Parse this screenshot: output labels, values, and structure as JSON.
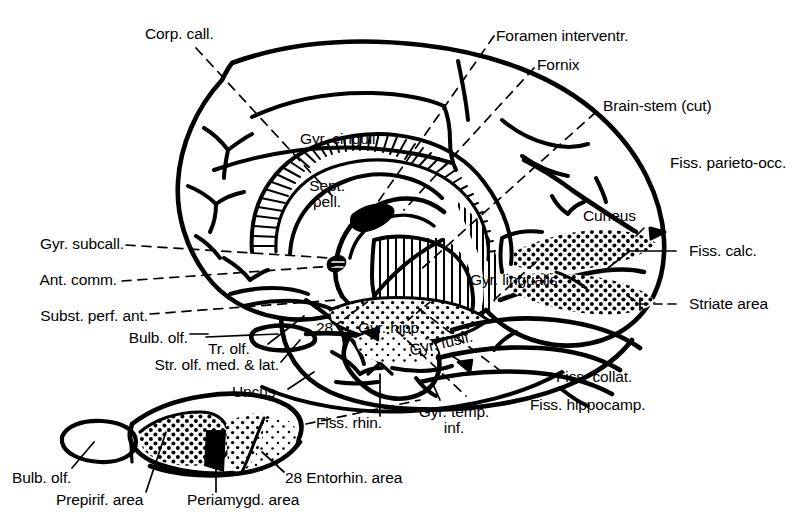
{
  "figure": {
    "ink_color": "#000000",
    "background_color": "#ffffff"
  },
  "main_diagram": {
    "name": "medial-sagittal-brain",
    "labels": {
      "corp_call": "Corp. call.",
      "foramen_interventr": "Foramen interventr.",
      "fornix": "Fornix",
      "brain_stem_cut": "Brain-stem (cut)",
      "gyr_cinguli": "Gyr. cinguli",
      "sept_pell_line1": "Sept.",
      "sept_pell_line2": "pell.",
      "fiss_parieto_occ": "Fiss. parieto-occ.",
      "cuneus": "Cuneus",
      "fiss_calc": "Fiss. calc.",
      "striate_area": "Striate area",
      "gyr_subcall": "Gyr. subcall.",
      "ant_comm": "Ant. comm.",
      "subst_perf_ant": "Subst. perf. ant.",
      "bulb_olf": "Bulb. olf.",
      "tr_olf": "Tr. olf.",
      "str_olf_med_lat": "Str. olf. med. & lat.",
      "uncus": "Uncus",
      "area_28": "28",
      "gyr_hipp": "Gyr. hipp.",
      "gyr_lingualis": "Gyr. lingualis",
      "gyr_fusif": "Gyr. fusif.",
      "fiss_collat": "Fiss. collat.",
      "fiss_hippocamp": "Fiss. hippocamp.",
      "gyr_temp_line1": "Gyr. temp.",
      "gyr_temp_line2": "inf.",
      "fiss_rhin": "Fiss. rhin."
    }
  },
  "inset_diagram": {
    "name": "olfactory-region-inset",
    "labels": {
      "bulb_olf": "Bulb. olf.",
      "prepirif_area": "Prepirif. area",
      "periamygd_area": "Periamygd. area",
      "entorhin_area": "28 Entorhin. area"
    }
  }
}
